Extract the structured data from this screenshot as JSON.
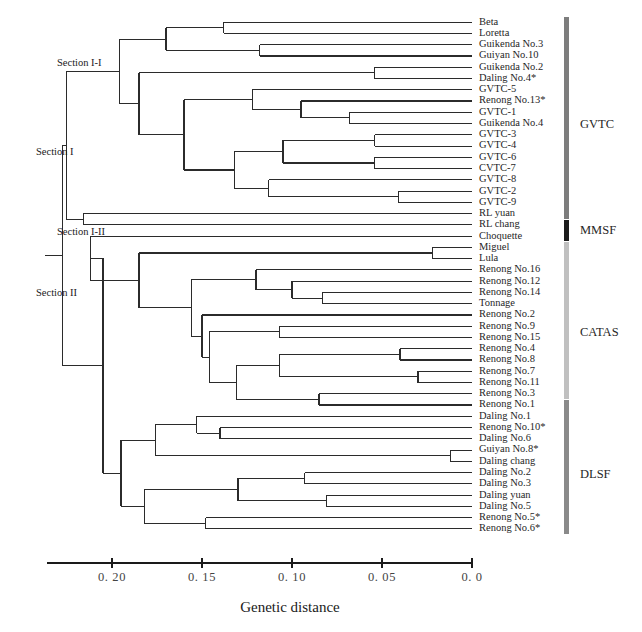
{
  "figure": {
    "axis_title": "Genetic distance",
    "tick_labels": [
      "0. 20",
      "0. 15",
      "0. 10",
      "0. 05",
      "0. 0"
    ],
    "tick_values": [
      0.2,
      0.15,
      0.1,
      0.05,
      0.0
    ]
  },
  "sections": [
    {
      "name": "section-i-i",
      "label": "Section I-I",
      "x": 57,
      "y": 64
    },
    {
      "name": "section-i",
      "label": "Section I",
      "x": 36,
      "y": 153
    },
    {
      "name": "section-i-ii",
      "label": "Section I-II",
      "x": 57,
      "y": 233
    },
    {
      "name": "section-ii",
      "label": "Section II",
      "x": 36,
      "y": 294
    }
  ],
  "groups": [
    {
      "name": "GVTC",
      "color": "#7d7d7d",
      "first_leaf": 0,
      "last_leaf": 17,
      "label_y": 125
    },
    {
      "name": "MMSF",
      "color": "#1c1c1c",
      "first_leaf": 18,
      "last_leaf": 19,
      "label_y": 231
    },
    {
      "name": "CATAS",
      "color": "#c0c0c0",
      "first_leaf": 20,
      "last_leaf": 33,
      "label_y": 333
    },
    {
      "name": "DLSF",
      "color": "#8a8a8a",
      "first_leaf": 34,
      "last_leaf": 45,
      "label_y": 475
    }
  ],
  "leaves": [
    "Beta",
    "Loretta",
    "Guikenda No.3",
    "Guiyan No.10",
    "Guikenda No.2",
    "Daling No.4*",
    "GVTC-5",
    "Renong No.13*",
    "GVTC-1",
    "Guikenda No.4",
    "GVTC-3",
    "GVTC-4",
    "GVTC-6",
    "CVTC-7",
    "GVTC-8",
    "GVTC-2",
    "GVTC-9",
    "RL yuan",
    "RL chang",
    "Choquette",
    "Miguel",
    "Lula",
    "Renong No.16",
    "Renong No.12",
    "Renong No.14",
    "Tonnage",
    "Renong No.2",
    "Renong No.9",
    "Renong No.15",
    "Renong No.4",
    "Renong No.8",
    "Renong No.7",
    "Renong No.11",
    "Renong No.3",
    "Renong No.1",
    "Daling No.1",
    "Renong No.10*",
    "Daling No.6",
    "Guiyan No.8*",
    "Daling chang",
    "Daling No.2",
    "Daling No.3",
    "Daling yuan",
    "Daling No.5",
    "Renong No.5*",
    "Renong No.6*"
  ],
  "chart_data": {
    "type": "dendrogram",
    "title": "",
    "xlabel": "Genetic distance",
    "ylabel": "",
    "xlim": [
      0.23,
      0.0
    ],
    "x_reversed": true,
    "axis_ticks": [
      0.2,
      0.15,
      0.1,
      0.05,
      0.0
    ],
    "n_leaves": 46,
    "leaf_order": [
      "Beta",
      "Loretta",
      "Guikenda No.3",
      "Guiyan No.10",
      "Guikenda No.2",
      "Daling No.4*",
      "GVTC-5",
      "Renong No.13*",
      "GVTC-1",
      "Guikenda No.4",
      "GVTC-3",
      "GVTC-4",
      "GVTC-6",
      "CVTC-7",
      "GVTC-8",
      "GVTC-2",
      "GVTC-9",
      "RL yuan",
      "RL chang",
      "Choquette",
      "Miguel",
      "Lula",
      "Renong No.16",
      "Renong No.12",
      "Renong No.14",
      "Tonnage",
      "Renong No.2",
      "Renong No.9",
      "Renong No.15",
      "Renong No.4",
      "Renong No.8",
      "Renong No.7",
      "Renong No.11",
      "Renong No.3",
      "Renong No.1",
      "Daling No.1",
      "Renong No.10*",
      "Daling No.6",
      "Guiyan No.8*",
      "Daling chang",
      "Daling No.2",
      "Daling No.3",
      "Daling yuan",
      "Daling No.5",
      "Renong No.5*",
      "Renong No.6*"
    ],
    "groups": [
      {
        "name": "GVTC",
        "members": [
          "Beta",
          "Loretta",
          "Guikenda No.3",
          "Guiyan No.10",
          "Guikenda No.2",
          "Daling No.4*",
          "GVTC-5",
          "Renong No.13*",
          "GVTC-1",
          "Guikenda No.4",
          "GVTC-3",
          "GVTC-4",
          "GVTC-6",
          "CVTC-7",
          "GVTC-8",
          "GVTC-2",
          "GVTC-9",
          "RL yuan"
        ]
      },
      {
        "name": "MMSF",
        "members": [
          "RL chang",
          "Choquette"
        ]
      },
      {
        "name": "CATAS",
        "members": [
          "Miguel",
          "Lula",
          "Renong No.16",
          "Renong No.12",
          "Renong No.14",
          "Tonnage",
          "Renong No.2",
          "Renong No.9",
          "Renong No.15",
          "Renong No.4",
          "Renong No.8",
          "Renong No.7",
          "Renong No.11",
          "Renong No.3"
        ]
      },
      {
        "name": "DLSF",
        "members": [
          "Renong No.1",
          "Daling No.1",
          "Renong No.10*",
          "Daling No.6",
          "Guiyan No.8*",
          "Daling chang",
          "Daling No.2",
          "Daling No.3",
          "Daling yuan",
          "Daling No.5",
          "Renong No.5*",
          "Renong No.6*"
        ]
      }
    ],
    "sections": [
      "Section I",
      "Section I-I",
      "Section I-II",
      "Section II"
    ],
    "merges": [
      {
        "height": 0.227,
        "children": [
          "Section I",
          "Section II"
        ]
      },
      {
        "height": 0.216,
        "children": [
          "Section I-I",
          "Section I-II"
        ]
      },
      {
        "height": 0.205,
        "children": [
          "Section II-A",
          "Section II-B"
        ]
      },
      {
        "height": 0.196,
        "children": [
          "Beta-Loretta-clade",
          "GVTC-core-clade"
        ]
      },
      {
        "height": 0.138,
        "children": [
          "Beta",
          "Loretta"
        ]
      },
      {
        "height": 0.118,
        "children": [
          "Guikenda No.3",
          "Guiyan No.10"
        ]
      },
      {
        "height": 0.054,
        "children": [
          "Guikenda No.2",
          "Daling No.4*"
        ]
      },
      {
        "height": 0.16,
        "children": [
          "GVTC-5-clade",
          "GVTC-3-clade"
        ]
      },
      {
        "height": 0.122,
        "children": [
          "GVTC-5",
          "Renong No.13*-clade"
        ]
      },
      {
        "height": 0.095,
        "children": [
          "Renong No.13*",
          "GVTC-1-Guikenda No.4"
        ]
      },
      {
        "height": 0.068,
        "children": [
          "GVTC-1",
          "Guikenda No.4"
        ]
      },
      {
        "height": 0.132,
        "children": [
          "GVTC-3-GVTC-6",
          "GVTC-8-clade"
        ]
      },
      {
        "height": 0.105,
        "children": [
          "GVTC-3-GVTC-4",
          "GVTC-6-CVTC-7"
        ]
      },
      {
        "height": 0.054,
        "children": [
          "GVTC-3",
          "GVTC-4"
        ]
      },
      {
        "height": 0.054,
        "children": [
          "GVTC-6",
          "CVTC-7"
        ]
      },
      {
        "height": 0.113,
        "children": [
          "GVTC-8-GVTC-2",
          "GVTC-9"
        ]
      },
      {
        "height": 0.041,
        "children": [
          "GVTC-2",
          "GVTC-9"
        ]
      },
      {
        "height": 0.216,
        "children": [
          "RL yuan",
          "RL chang"
        ]
      },
      {
        "height": 0.212,
        "children": [
          "Choquette",
          "CATAS-clade"
        ]
      },
      {
        "height": 0.185,
        "children": [
          "Miguel-Lula",
          "Renong-clade"
        ]
      },
      {
        "height": 0.022,
        "children": [
          "Miguel",
          "Lula"
        ]
      },
      {
        "height": 0.156,
        "children": [
          "Renong No.16-clade",
          "Renong No.2-clade"
        ]
      },
      {
        "height": 0.12,
        "children": [
          "Renong No.16",
          "Renong No.12-clade"
        ]
      },
      {
        "height": 0.1,
        "children": [
          "Renong No.12",
          "Renong No.14-Tonnage"
        ]
      },
      {
        "height": 0.083,
        "children": [
          "Renong No.14",
          "Tonnage"
        ]
      },
      {
        "height": 0.15,
        "children": [
          "Renong No.2",
          "Renong No.9-clade"
        ]
      },
      {
        "height": 0.146,
        "children": [
          "Renong No.9-Renong No.15",
          "Renong No.4-clade"
        ]
      },
      {
        "height": 0.107,
        "children": [
          "Renong No.9",
          "Renong No.15"
        ]
      },
      {
        "height": 0.131,
        "children": [
          "Renong No.4-clade",
          "Renong No.3-Renong No.1"
        ]
      },
      {
        "height": 0.107,
        "children": [
          "Renong No.4-Renong No.8",
          "Renong No.7-Renong No.11"
        ]
      },
      {
        "height": 0.04,
        "children": [
          "Renong No.4",
          "Renong No.8"
        ]
      },
      {
        "height": 0.03,
        "children": [
          "Renong No.7",
          "Renong No.11"
        ]
      },
      {
        "height": 0.085,
        "children": [
          "Renong No.3",
          "Renong No.1"
        ]
      },
      {
        "height": 0.195,
        "children": [
          "DLSF-A",
          "DLSF-B"
        ]
      },
      {
        "height": 0.176,
        "children": [
          "Daling No.1-clade",
          "Guiyan No.8*-clade"
        ]
      },
      {
        "height": 0.153,
        "children": [
          "Daling No.1",
          "Renong No.10*-Daling No.6"
        ]
      },
      {
        "height": 0.14,
        "children": [
          "Renong No.10*",
          "Daling No.6"
        ]
      },
      {
        "height": 0.165,
        "children": [
          "Daling chang",
          "Guiyan No.8*-pair"
        ]
      },
      {
        "height": 0.012,
        "children": [
          "Guiyan No.8*",
          "Daling chang"
        ]
      },
      {
        "height": 0.182,
        "children": [
          "Daling No.2-clade",
          "Renong No.5*-Renong No.6*"
        ]
      },
      {
        "height": 0.13,
        "children": [
          "Daling No.2-Daling No.3",
          "Daling yuan-Daling No.5"
        ]
      },
      {
        "height": 0.093,
        "children": [
          "Daling No.2",
          "Daling No.3"
        ]
      },
      {
        "height": 0.081,
        "children": [
          "Daling yuan",
          "Daling No.5"
        ]
      },
      {
        "height": 0.148,
        "children": [
          "Renong No.5*",
          "Renong No.6*"
        ]
      }
    ]
  }
}
